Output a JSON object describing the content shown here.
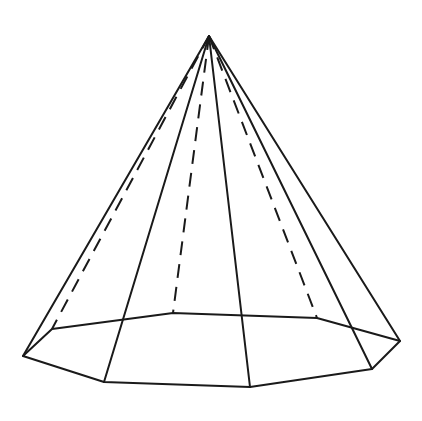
{
  "figure": {
    "apex": [
      209,
      36
    ],
    "base_vertices": {
      "left": [
        23,
        356
      ],
      "front_left": [
        104,
        382
      ],
      "front": [
        250,
        387
      ],
      "front_right": [
        372,
        369
      ],
      "right": [
        400,
        341
      ],
      "back_right": [
        317,
        318
      ],
      "back": [
        173,
        313
      ],
      "back_left": [
        52,
        329
      ]
    },
    "visible_lateral_edges": [
      "left",
      "front_left",
      "front",
      "front_right",
      "right"
    ],
    "hidden_lateral_edges": [
      "back_left",
      "back",
      "back_right"
    ],
    "stroke_color": "#1a1a1a",
    "background": "#ffffff"
  }
}
